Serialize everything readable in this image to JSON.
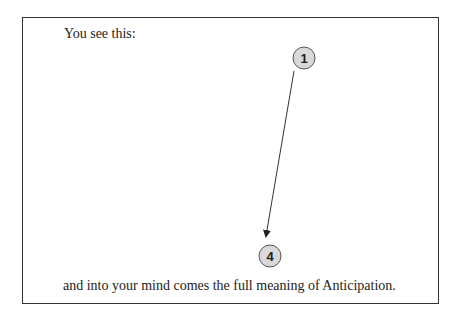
{
  "diagram": {
    "intro_text": "You see this:",
    "conclusion_text": "and into your mind comes the full meaning of Anticipation.",
    "nodes": [
      {
        "label": "1",
        "cx": 304,
        "cy": 58
      },
      {
        "label": "4",
        "cx": 270,
        "cy": 256
      }
    ],
    "edge": {
      "from": "1",
      "to": "4",
      "arrow": "end"
    },
    "colors": {
      "node_fill": "#d9d9d9",
      "node_stroke": "#555555",
      "line": "#333333"
    }
  }
}
